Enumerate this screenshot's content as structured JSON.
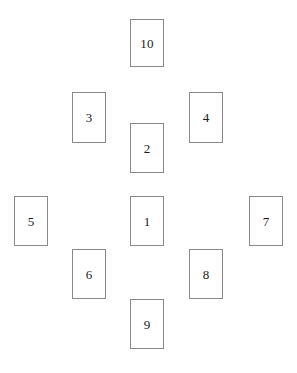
{
  "diagram": {
    "background_color": "#ffffff",
    "card_fill_color": "#ffffff",
    "card_border_color": "#8a8a8a",
    "label_color": "#1a1a1a",
    "canvas": {
      "width": 297,
      "height": 373
    },
    "card_size": {
      "width": 34,
      "height": 50
    },
    "cards": [
      {
        "label": "10",
        "x": 130,
        "y": 19,
        "width": 34,
        "height": 48
      },
      {
        "label": "3",
        "x": 72,
        "y": 92,
        "width": 34,
        "height": 51
      },
      {
        "label": "4",
        "x": 189,
        "y": 92,
        "width": 34,
        "height": 51
      },
      {
        "label": "2",
        "x": 130,
        "y": 123,
        "width": 34,
        "height": 50
      },
      {
        "label": "5",
        "x": 14,
        "y": 196,
        "width": 34,
        "height": 50
      },
      {
        "label": "1",
        "x": 130,
        "y": 196,
        "width": 34,
        "height": 50
      },
      {
        "label": "7",
        "x": 249,
        "y": 196,
        "width": 34,
        "height": 50
      },
      {
        "label": "6",
        "x": 72,
        "y": 249,
        "width": 34,
        "height": 50
      },
      {
        "label": "8",
        "x": 189,
        "y": 249,
        "width": 34,
        "height": 50
      },
      {
        "label": "9",
        "x": 130,
        "y": 299,
        "width": 34,
        "height": 50
      }
    ]
  }
}
